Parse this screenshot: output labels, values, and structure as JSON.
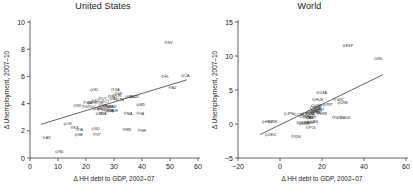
{
  "figure": {
    "panels": [
      "united-states",
      "world"
    ]
  },
  "chart_data": [
    {
      "type": "scatter",
      "title": "United States",
      "xlabel": "Δ HH debt to GDP, 2002–07",
      "ylabel": "Δ Unemployment, 2007–10",
      "xlim": [
        0,
        60
      ],
      "ylim": [
        0,
        10
      ],
      "xticks": [
        0,
        10,
        20,
        30,
        40,
        50,
        60
      ],
      "yticks": [
        0,
        2,
        4,
        6,
        8,
        10
      ],
      "grid": false,
      "legend": "none",
      "fit_line": {
        "x": [
          4.0,
          56.0
        ],
        "y": [
          2.48,
          5.75
        ]
      },
      "points": [
        {
          "label": "NV",
          "x": 48.5,
          "y": 8.5
        },
        {
          "label": "CA",
          "x": 54.5,
          "y": 6.05
        },
        {
          "label": "FL",
          "x": 47.5,
          "y": 6.0
        },
        {
          "label": "AZ",
          "x": 50.0,
          "y": 5.2
        },
        {
          "label": "NC",
          "x": 22.0,
          "y": 5.0
        },
        {
          "label": "GA",
          "x": 29.5,
          "y": 5.05
        },
        {
          "label": "MI",
          "x": 30.8,
          "y": 4.75
        },
        {
          "label": "OR",
          "x": 30.0,
          "y": 4.6
        },
        {
          "label": "SC",
          "x": 28.3,
          "y": 4.55
        },
        {
          "label": "ID",
          "x": 34.5,
          "y": 4.5
        },
        {
          "label": "NJ",
          "x": 35.8,
          "y": 4.5
        },
        {
          "label": "CO",
          "x": 36.5,
          "y": 4.5
        },
        {
          "label": "UT",
          "x": 25.0,
          "y": 4.4
        },
        {
          "label": "AL",
          "x": 29.0,
          "y": 4.35
        },
        {
          "label": "TN",
          "x": 31.2,
          "y": 4.3
        },
        {
          "label": "KY",
          "x": 22.5,
          "y": 4.2
        },
        {
          "label": "CT",
          "x": 26.0,
          "y": 4.15
        },
        {
          "label": "IN",
          "x": 24.0,
          "y": 4.1
        },
        {
          "label": "WA",
          "x": 19.5,
          "y": 4.1
        },
        {
          "label": "OH",
          "x": 21.0,
          "y": 4.05
        },
        {
          "label": "WI",
          "x": 16.0,
          "y": 3.85
        },
        {
          "label": "IL",
          "x": 19.0,
          "y": 3.8
        },
        {
          "label": "DC",
          "x": 21.0,
          "y": 3.8
        },
        {
          "label": "DE",
          "x": 25.0,
          "y": 3.85
        },
        {
          "label": "MO",
          "x": 26.5,
          "y": 3.8
        },
        {
          "label": "RI",
          "x": 27.5,
          "y": 3.8
        },
        {
          "label": "AR",
          "x": 28.5,
          "y": 3.75
        },
        {
          "label": "MD",
          "x": 38.5,
          "y": 3.9
        },
        {
          "label": "MS",
          "x": 23.0,
          "y": 3.6
        },
        {
          "label": "NY",
          "x": 24.5,
          "y": 3.6
        },
        {
          "label": "TX",
          "x": 26.0,
          "y": 3.55
        },
        {
          "label": "NM",
          "x": 27.0,
          "y": 3.5
        },
        {
          "label": "PA",
          "x": 27.8,
          "y": 3.45
        },
        {
          "label": "HI",
          "x": 29.5,
          "y": 3.45
        },
        {
          "label": "LA",
          "x": 25.2,
          "y": 3.3
        },
        {
          "label": "WY",
          "x": 24.0,
          "y": 3.25
        },
        {
          "label": "MA",
          "x": 34.0,
          "y": 3.3
        },
        {
          "label": "VA",
          "x": 38.5,
          "y": 3.3
        },
        {
          "label": "OK",
          "x": 12.5,
          "y": 2.5
        },
        {
          "label": "KS",
          "x": 15.0,
          "y": 2.25
        },
        {
          "label": "IA",
          "x": 17.0,
          "y": 2.1
        },
        {
          "label": "SD",
          "x": 22.5,
          "y": 2.15
        },
        {
          "label": "MN",
          "x": 33.5,
          "y": 2.1
        },
        {
          "label": "NH",
          "x": 39.0,
          "y": 2.05
        },
        {
          "label": "NE",
          "x": 16.5,
          "y": 1.7
        },
        {
          "label": "VT",
          "x": 23.0,
          "y": 1.75
        },
        {
          "label": "AK",
          "x": 5.0,
          "y": 1.5
        },
        {
          "label": "ND",
          "x": 9.5,
          "y": 0.45
        }
      ]
    },
    {
      "type": "scatter",
      "title": "World",
      "xlabel": "Δ HH debt to GDP, 2002–07",
      "ylabel": "Δ Unemployment, 2007–10",
      "xlim": [
        -20,
        60
      ],
      "ylim": [
        -5,
        15
      ],
      "xticks": [
        -20,
        0,
        20,
        40,
        60
      ],
      "yticks": [
        -5,
        0,
        5,
        10,
        15
      ],
      "grid": false,
      "legend": "none",
      "fit_line": {
        "x": [
          -9.5,
          49.0
        ],
        "y": [
          -1.55,
          7.25
        ]
      },
      "points": [
        {
          "label": "ESP",
          "x": 30.5,
          "y": 11.5
        },
        {
          "label": "IRL",
          "x": 45.5,
          "y": 9.6
        },
        {
          "label": "USA",
          "x": 18.0,
          "y": 4.6
        },
        {
          "label": "HUN",
          "x": 16.0,
          "y": 3.6
        },
        {
          "label": "GRC",
          "x": 26.0,
          "y": 3.6
        },
        {
          "label": "DNK",
          "x": 28.0,
          "y": 3.1
        },
        {
          "label": "PRT",
          "x": 21.0,
          "y": 2.8
        },
        {
          "label": "GBR",
          "x": 15.5,
          "y": 2.7
        },
        {
          "label": "SWE",
          "x": 15.0,
          "y": 2.4
        },
        {
          "label": "ISL",
          "x": 16.5,
          "y": 2.3
        },
        {
          "label": "EST",
          "x": 17.0,
          "y": 2.1
        },
        {
          "label": "FIN",
          "x": 14.5,
          "y": 2.0
        },
        {
          "label": "NZL",
          "x": 16.0,
          "y": 1.9
        },
        {
          "label": "SVK",
          "x": 13.5,
          "y": 1.8
        },
        {
          "label": "FRA",
          "x": 15.0,
          "y": 1.7
        },
        {
          "label": "ITA",
          "x": 13.0,
          "y": 1.6
        },
        {
          "label": "SRB",
          "x": 18.0,
          "y": 1.6
        },
        {
          "label": "JPN",
          "x": 2.5,
          "y": 1.5
        },
        {
          "label": "CZE",
          "x": 7.0,
          "y": 1.4
        },
        {
          "label": "BGR",
          "x": 11.0,
          "y": 1.5
        },
        {
          "label": "LUX",
          "x": 12.5,
          "y": 1.2
        },
        {
          "label": "TUR",
          "x": 10.0,
          "y": 1.1
        },
        {
          "label": "CHE",
          "x": 11.5,
          "y": 1.0
        },
        {
          "label": "AUT",
          "x": 13.0,
          "y": 0.9
        },
        {
          "label": "NLD",
          "x": 25.5,
          "y": 1.0
        },
        {
          "label": "AUS",
          "x": 29.0,
          "y": 1.0
        },
        {
          "label": "HRV",
          "x": -8.0,
          "y": 0.3
        },
        {
          "label": "ISR",
          "x": -5.0,
          "y": 0.3
        },
        {
          "label": "NOR",
          "x": 8.5,
          "y": 0.2
        },
        {
          "label": "KOR",
          "x": 9.5,
          "y": 0.0
        },
        {
          "label": "BEL",
          "x": 12.0,
          "y": 0.2
        },
        {
          "label": "CAN",
          "x": 13.5,
          "y": 0.3
        },
        {
          "label": "POL",
          "x": 13.0,
          "y": -0.5
        },
        {
          "label": "DEU",
          "x": -6.5,
          "y": -1.6
        },
        {
          "label": "IDN",
          "x": 6.0,
          "y": -1.8
        }
      ]
    }
  ]
}
